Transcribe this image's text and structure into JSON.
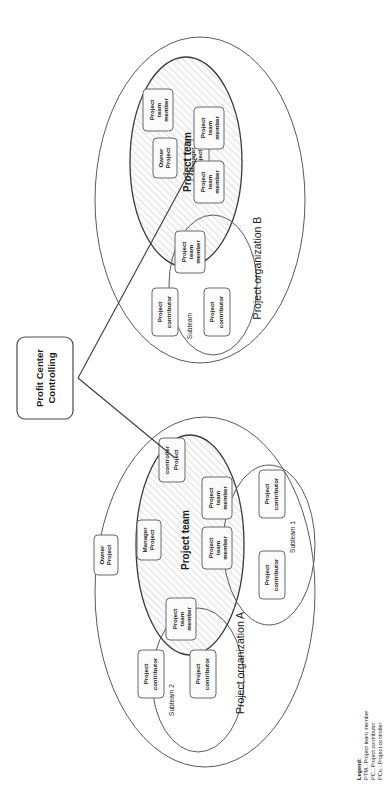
{
  "diagram": {
    "root": {
      "label_line1": "Profit Center",
      "label_line2": "Controlling",
      "label": "Profit Center Controlling"
    },
    "organizations": [
      {
        "id": "org-b",
        "label": "Project organization B",
        "team_label": "Project team",
        "owner": {
          "line1": "Project",
          "line2": "Owner",
          "label": "Project Owner"
        },
        "manager": {
          "line1": "Project",
          "line2": "Manager",
          "label": "Project Manager"
        },
        "team_members": [
          {
            "line1": "Project",
            "line2": "team",
            "line3": "member",
            "label": "Project team member"
          },
          {
            "line1": "Project",
            "line2": "team",
            "line3": "member",
            "label": "Project team member"
          },
          {
            "line1": "Project",
            "line2": "team",
            "line3": "member",
            "label": "Project team member"
          },
          {
            "line1": "Project",
            "line2": "team",
            "line3": "member",
            "label": "Project team member"
          }
        ],
        "subteams": [
          {
            "label": "Subteam",
            "contributors": [
              {
                "line1": "Project",
                "line2": "contributor",
                "label": "Project contributor"
              },
              {
                "line1": "Project",
                "line2": "contributor",
                "label": "Project contributor"
              }
            ]
          }
        ]
      },
      {
        "id": "org-a",
        "label": "Project organization A",
        "team_label": "Project team",
        "owner": {
          "line1": "Project",
          "line2": "Owner",
          "label": "Project Owner"
        },
        "manager": {
          "line1": "Project",
          "line2": "Manager",
          "label": "Project Manager"
        },
        "controller": {
          "line1": "Project",
          "line2": "controller",
          "label": "Project controller"
        },
        "team_members": [
          {
            "line1": "Project",
            "line2": "team",
            "line3": "member",
            "label": "Project team member"
          },
          {
            "line1": "Project",
            "line2": "team",
            "line3": "member",
            "label": "Project team member"
          },
          {
            "line1": "Project",
            "line2": "team",
            "line3": "member",
            "label": "Project team member"
          }
        ],
        "subteams": [
          {
            "label": "Subteam 1",
            "contributors": [
              {
                "line1": "Project",
                "line2": "contributor",
                "label": "Project contributor"
              },
              {
                "line1": "Project",
                "line2": "contributor",
                "label": "Project contributor"
              }
            ]
          },
          {
            "label": "Subteam 2",
            "contributors": [
              {
                "line1": "Project",
                "line2": "contributor",
                "label": "Project contributor"
              },
              {
                "line1": "Project",
                "line2": "contributor",
                "label": "Project contributor"
              }
            ]
          }
        ]
      }
    ],
    "legend": {
      "title": "Legend:",
      "entries": [
        "PTM...Project team member",
        "PC...Project contributor",
        "PCo...Project controller"
      ]
    },
    "colors": {
      "outline": "#5a5a5a",
      "team_outline": "#3a3a3a",
      "box_fill": "#fbfbfb",
      "box_stroke": "#6a6a6a",
      "text": "#1a1a1a",
      "hatch": "#c9c9c9",
      "background": "#ffffff"
    }
  }
}
